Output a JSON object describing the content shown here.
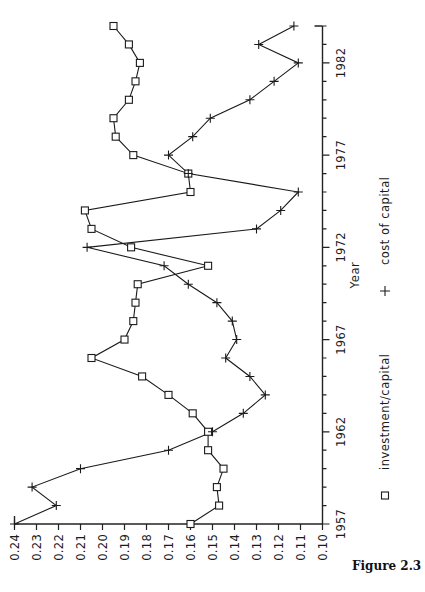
{
  "figure": {
    "caption": "Figure 2.3",
    "orientation": "rotated-90-ccw"
  },
  "axes": {
    "x_title": "Year",
    "x_tick_labels": [
      "1957",
      "1962",
      "1967",
      "1972",
      "1977",
      "1982"
    ],
    "y_tick_labels": [
      "0.24",
      "0.23",
      "0.22",
      "0.21",
      "0.20",
      "0.19",
      "0.18",
      "0.17",
      "0.16",
      "0.15",
      "0.14",
      "0.13",
      "0.12",
      "0.11",
      "0.10"
    ]
  },
  "legend": {
    "entries": [
      {
        "marker": "square-marker",
        "label": "investment/capital"
      },
      {
        "marker": "plus-marker",
        "label": "cost of capital"
      }
    ]
  },
  "chart_data": {
    "type": "line",
    "title": "",
    "xlabel": "Year",
    "ylabel": "",
    "xlim": [
      1957,
      1984
    ],
    "ylim": [
      0.1,
      0.24
    ],
    "grid": false,
    "legend_position": "below",
    "x": [
      1957,
      1958,
      1959,
      1960,
      1961,
      1962,
      1963,
      1964,
      1965,
      1966,
      1967,
      1968,
      1969,
      1970,
      1971,
      1972,
      1973,
      1974,
      1975,
      1976,
      1977,
      1978,
      1979,
      1980,
      1981,
      1982,
      1983,
      1984
    ],
    "series": [
      {
        "name": "investment/capital",
        "marker": "square",
        "values": [
          0.16,
          0.147,
          0.148,
          0.145,
          0.152,
          0.152,
          0.159,
          0.17,
          0.182,
          0.205,
          0.19,
          0.186,
          0.185,
          0.184,
          0.152,
          0.187,
          0.205,
          0.208,
          0.16,
          0.161,
          0.186,
          0.194,
          0.195,
          0.188,
          0.185,
          0.183,
          0.188,
          0.195
        ]
      },
      {
        "name": "cost of capital",
        "marker": "plus",
        "values": [
          0.24,
          0.221,
          0.232,
          0.21,
          0.17,
          0.15,
          0.136,
          0.126,
          0.133,
          0.144,
          0.139,
          0.141,
          0.148,
          0.161,
          0.172,
          0.207,
          0.13,
          0.119,
          0.111,
          0.161,
          0.17,
          0.159,
          0.151,
          0.133,
          0.122,
          0.111,
          0.129,
          0.113
        ]
      }
    ]
  }
}
